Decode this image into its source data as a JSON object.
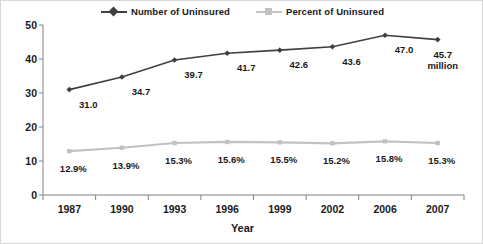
{
  "chart_data": {
    "type": "line",
    "title": "",
    "xlabel": "Year",
    "ylabel": "",
    "categories": [
      "1987",
      "1990",
      "1993",
      "1996",
      "1999",
      "2002",
      "2006",
      "2007"
    ],
    "ylim": [
      0,
      50
    ],
    "yticks": [
      "0",
      "10",
      "20",
      "30",
      "40",
      "50"
    ],
    "grid": false,
    "legend_position": "top-center",
    "series": [
      {
        "name": "Number of Uninsured",
        "color": "#3f3f3f",
        "marker": "diamond",
        "values": [
          31.0,
          34.7,
          39.7,
          41.7,
          42.6,
          43.6,
          47.0,
          45.7
        ],
        "labels": [
          "31.0",
          "34.7",
          "39.7",
          "41.7",
          "42.6",
          "43.6",
          "47.0",
          "45.7"
        ],
        "unit_note": "million"
      },
      {
        "name": "Percent of Uninsured",
        "color": "#c2c2c2",
        "marker": "square",
        "values": [
          12.9,
          13.9,
          15.3,
          15.6,
          15.5,
          15.2,
          15.8,
          15.3
        ],
        "labels": [
          "12.9%",
          "13.9%",
          "15.3%",
          "15.6%",
          "15.5%",
          "15.2%",
          "15.8%",
          "15.3%"
        ]
      }
    ]
  },
  "legend": {
    "entries": [
      {
        "label": "Number of Uninsured"
      },
      {
        "label": "Percent of Uninsured"
      }
    ]
  },
  "colors": {
    "series_number": "#3f3f3f",
    "series_percent": "#c2c2c2",
    "axis": "#808080",
    "text": "#1a1a1a"
  }
}
